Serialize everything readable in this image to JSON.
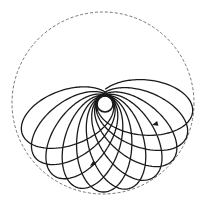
{
  "diagram": {
    "type": "precessing-orbit-rosette",
    "background": "#ffffff",
    "stroke_color": "#1a1a1a",
    "boundary_color": "#555555",
    "boundary_circle": {
      "cx": 103,
      "cy": 103,
      "r": 91,
      "dashed": true
    },
    "inner_circle": {
      "cx": 105,
      "cy": 104,
      "r": 8
    },
    "orbit": {
      "focus": {
        "x": 105,
        "y": 104
      },
      "perihelion": 8,
      "aphelion": 88,
      "start_angle_deg": 200,
      "end_angle_deg": 355,
      "loop_count": 10
    },
    "arrows": [
      {
        "name": "arrow-right-loop",
        "x": 152,
        "y": 125,
        "angle_deg": 165
      },
      {
        "name": "arrow-lower-loop",
        "x": 90,
        "y": 166,
        "angle_deg": 145
      }
    ]
  }
}
